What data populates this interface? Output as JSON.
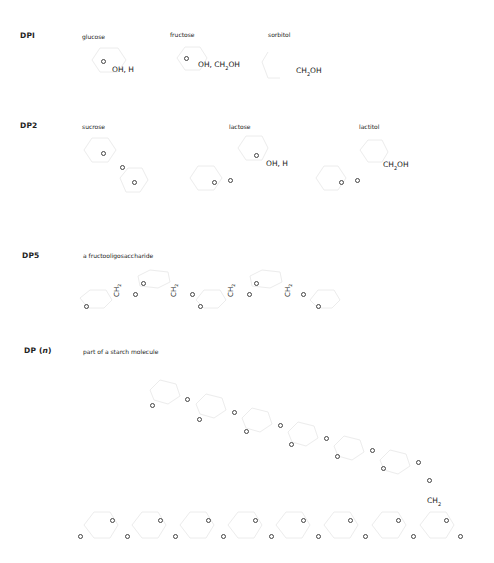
{
  "rows": [
    {
      "id": "dp1",
      "label": "DPI",
      "molecules": [
        {
          "name": "glucose",
          "substituent": "OH, H"
        },
        {
          "name": "fructose",
          "substituent": "OH, CH",
          "substituent_sub": "2",
          "substituent_tail": "OH"
        },
        {
          "name": "sorbitol",
          "substituent": "CH",
          "substituent_sub": "2",
          "substituent_tail": "OH"
        }
      ]
    },
    {
      "id": "dp2",
      "label": "DP2",
      "molecules": [
        {
          "name": "sucrose"
        },
        {
          "name": "lactose",
          "substituent": "OH, H"
        },
        {
          "name": "lactitol",
          "substituent": "CH",
          "substituent_sub": "2",
          "substituent_tail": "OH"
        }
      ]
    },
    {
      "id": "dp5",
      "label": "DP5",
      "molecules": [
        {
          "name": "a fructooligosaccharide",
          "bridge_group": "CH",
          "bridge_sub": "2"
        }
      ]
    },
    {
      "id": "dpn",
      "label": "DP (",
      "label_italic": "n",
      "label_tail": ")",
      "molecules": [
        {
          "name": "part of a starch molecule",
          "branch_group": "CH",
          "branch_sub": "2"
        }
      ]
    }
  ],
  "ring_atom": "O"
}
